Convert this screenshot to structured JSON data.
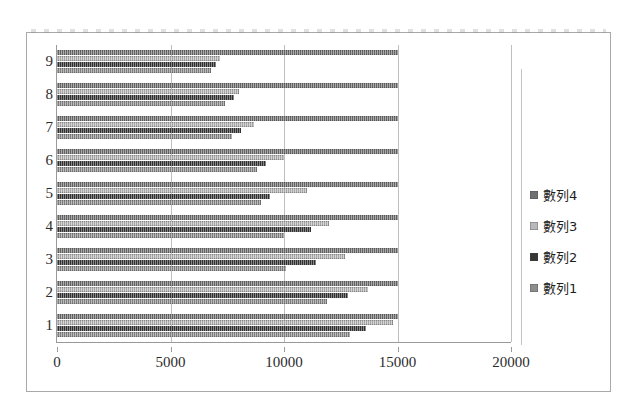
{
  "chart_data": {
    "type": "bar",
    "orientation": "horizontal",
    "title": "",
    "subtitle": "",
    "xlabel": "",
    "ylabel": "",
    "categories": [
      "1",
      "2",
      "3",
      "4",
      "5",
      "6",
      "7",
      "8",
      "9"
    ],
    "xlim": [
      0,
      20000
    ],
    "xticks": [
      0,
      5000,
      10000,
      15000,
      20000
    ],
    "xtick_labels": [
      "0",
      "5000",
      "10000",
      "15000",
      "20000"
    ],
    "ytick_labels": [
      "9",
      "8",
      "7",
      "6",
      "5",
      "4",
      "3",
      "2",
      "1"
    ],
    "grid": true,
    "grid_axis": "x",
    "legend_position": "right",
    "series": [
      {
        "name": "數列1",
        "color": "#8d8d8d",
        "values": [
          12900,
          11900,
          10100,
          10000,
          9000,
          8800,
          7700,
          7400,
          6800
        ]
      },
      {
        "name": "數列2",
        "color": "#363636",
        "values": [
          13600,
          12800,
          11400,
          11200,
          9400,
          9200,
          8100,
          7800,
          7000
        ]
      },
      {
        "name": "數列3",
        "color": "#b9b9b9",
        "values": [
          14800,
          13700,
          12700,
          12000,
          11000,
          10000,
          8700,
          8000,
          7200
        ]
      },
      {
        "name": "數列4",
        "color": "#707070",
        "values": [
          15000,
          15000,
          15000,
          15000,
          15000,
          15000,
          15000,
          15000,
          15000
        ]
      }
    ],
    "legend_entries": [
      {
        "label": "數列4",
        "color": "#707070"
      },
      {
        "label": "數列3",
        "color": "#b9b9b9"
      },
      {
        "label": "數列2",
        "color": "#363636"
      },
      {
        "label": "數列1",
        "color": "#8d8d8d"
      }
    ]
  }
}
